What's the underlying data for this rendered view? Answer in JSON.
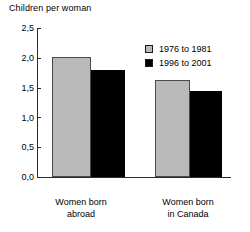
{
  "chart_data": {
    "type": "bar",
    "title": "Children per woman",
    "xlabel": "",
    "ylabel": "Children per woman",
    "categories": [
      "Women born abroad",
      "Women born in Canada"
    ],
    "category_lines": [
      [
        "Women born",
        "abroad"
      ],
      [
        "Women born",
        "in Canada"
      ]
    ],
    "series": [
      {
        "name": "1976 to 1981",
        "values": [
          2.02,
          1.62
        ],
        "color": "#b9b9b9"
      },
      {
        "name": "1996 to 2001",
        "values": [
          1.8,
          1.45
        ],
        "color": "#000000"
      }
    ],
    "ylim": [
      0.0,
      2.5
    ],
    "yticks": [
      0.0,
      0.5,
      1.0,
      1.5,
      2.0,
      2.5
    ],
    "ytick_labels": [
      "0,0",
      "0,5",
      "1,0",
      "1,5",
      "2,0",
      "2,5"
    ],
    "decimal_separator": ",",
    "grid": false,
    "legend_position": "upper-right-inside"
  },
  "legend": {
    "entries": [
      {
        "label": "1976 to 1981",
        "swatch": "gray-square-swatch"
      },
      {
        "label": "1996 to 2001",
        "swatch": "black-square-swatch"
      }
    ]
  },
  "axis": {
    "title": "Children per woman",
    "ytick_labels": [
      "2,5",
      "2,0",
      "1,5",
      "1,0",
      "0,5",
      "0,0"
    ]
  }
}
